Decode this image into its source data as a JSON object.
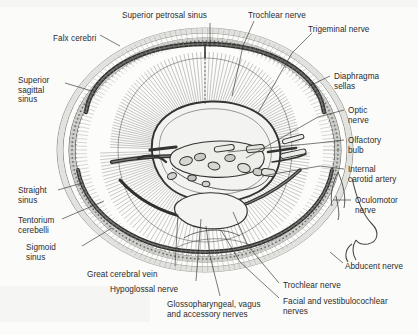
{
  "figure": {
    "kind": "anatomical-illustration",
    "view": "superior view of cranial base with dura mater, venous sinuses and cranial nerves",
    "background_color": "#fbfbfa",
    "ink_color": "#2b2b2b",
    "dura_fill": "#d9d9d6",
    "shade_fill": "#c2c2bf"
  },
  "labels": [
    {
      "id": "superior-petrosal-sinus",
      "text": "Superior petrosal sinus",
      "x": 122,
      "y": 11,
      "align": "left",
      "lines": [
        "Superior petrosal sinus"
      ]
    },
    {
      "id": "trochlear-nerve-top",
      "text": "Trochlear nerve",
      "x": 248,
      "y": 11,
      "align": "left",
      "lines": [
        "Trochlear nerve"
      ]
    },
    {
      "id": "trigeminal-nerve",
      "text": "Trigeminal nerve",
      "x": 308,
      "y": 25,
      "align": "left",
      "lines": [
        "Trigeminal nerve"
      ]
    },
    {
      "id": "falx-cerebri",
      "text": "Falx cerebri",
      "x": 53,
      "y": 34,
      "align": "left",
      "lines": [
        "Falx cerebri"
      ]
    },
    {
      "id": "superior-sagittal-sinus",
      "text": "Superior sagittal sinus",
      "x": 18,
      "y": 76,
      "align": "left",
      "lines": [
        "Superior",
        "sagittal",
        "sinus"
      ]
    },
    {
      "id": "diaphragma-sellas",
      "text": "Diaphragma sellas",
      "x": 334,
      "y": 72,
      "align": "left",
      "lines": [
        "Diaphragma",
        "sellas"
      ]
    },
    {
      "id": "optic-nerve",
      "text": "Optic nerve",
      "x": 348,
      "y": 106,
      "align": "left",
      "lines": [
        "Optic",
        "nerve"
      ]
    },
    {
      "id": "olfactory-bulb",
      "text": "Olfactory bulb",
      "x": 348,
      "y": 136,
      "align": "left",
      "lines": [
        "Olfactory",
        "bulb"
      ]
    },
    {
      "id": "internal-carotid-artery",
      "text": "Internal carotid artery",
      "x": 348,
      "y": 165,
      "align": "left",
      "lines": [
        "Internal",
        "carotid artery"
      ]
    },
    {
      "id": "oculomotor-nerve",
      "text": "Oculomotor nerve",
      "x": 355,
      "y": 196,
      "align": "left",
      "lines": [
        "Oculomotor",
        "nerve"
      ]
    },
    {
      "id": "straight-sinus",
      "text": "Straight sinus",
      "x": 18,
      "y": 186,
      "align": "left",
      "lines": [
        "Straight",
        "sinus"
      ]
    },
    {
      "id": "tentorium-cerebelli",
      "text": "Tentorium cerebelli",
      "x": 18,
      "y": 216,
      "align": "left",
      "lines": [
        "Tentorium",
        "cerebelli"
      ]
    },
    {
      "id": "sigmoid-sinus",
      "text": "Sigmoid sinus",
      "x": 26,
      "y": 243,
      "align": "left",
      "lines": [
        "Sigmoid",
        "sinus"
      ]
    },
    {
      "id": "great-cerebral-vein",
      "text": "Great cerebral vein",
      "x": 87,
      "y": 270,
      "align": "left",
      "lines": [
        "Great cerebral vein"
      ]
    },
    {
      "id": "hypoglossal-nerve",
      "text": "Hypoglossal nerve",
      "x": 110,
      "y": 285,
      "align": "left",
      "lines": [
        "Hypoglossal nerve"
      ]
    },
    {
      "id": "glossopharyngeal-vagus-accessory-nerves",
      "text": "Glossopharyngeal, vagus and accessory nerves",
      "x": 167,
      "y": 300,
      "align": "left",
      "lines": [
        "Glossopharyngeal, vagus",
        "and accessory nerves"
      ]
    },
    {
      "id": "trochlear-nerve-bottom",
      "text": "Trochlear nerve",
      "x": 283,
      "y": 281,
      "align": "left",
      "lines": [
        "Trochlear nerve"
      ]
    },
    {
      "id": "facial-and-vestibulocochlear-nerves",
      "text": "Facial and vestibulocochlear nerves",
      "x": 283,
      "y": 297,
      "align": "left",
      "lines": [
        "Facial and vestibulocochlear",
        "nerves"
      ]
    },
    {
      "id": "abducent-nerve",
      "text": "Abducent nerve",
      "x": 345,
      "y": 262,
      "align": "left",
      "lines": [
        "Abducent nerve"
      ]
    }
  ],
  "leaders": [
    {
      "id": "leader-superior-petrosal-sinus",
      "d": "M 210,23 L 210,47"
    },
    {
      "id": "leader-trochlear-nerve-top",
      "d": "M 254,21 L 243,46 L 232,96"
    },
    {
      "id": "leader-trigeminal-nerve",
      "d": "M 312,33 L 292,53 L 258,113"
    },
    {
      "id": "leader-falx-cerebri",
      "d": "M 100,35 L 120,46"
    },
    {
      "id": "leader-superior-sagittal-sinus",
      "d": "M 65,83 L 92,91"
    },
    {
      "id": "leader-diaphragma-sellas",
      "d": "M 330,76 L 309,86"
    },
    {
      "id": "leader-optic-nerve",
      "d": "M 344,110 L 318,117 L 246,158"
    },
    {
      "id": "leader-olfactory-bulb",
      "d": "M 344,140 L 318,143 L 228,152"
    },
    {
      "id": "leader-internal-carotid-artery",
      "d": "M 344,169 L 320,166 L 262,176"
    },
    {
      "id": "leader-oculomotor-nerve",
      "d": "M 351,200 L 333,200"
    },
    {
      "id": "leader-straight-sinus",
      "d": "M 58,190 L 82,183"
    },
    {
      "id": "leader-tentorium-cerebelli",
      "d": "M 62,219 L 104,201"
    },
    {
      "id": "leader-sigmoid-sinus",
      "d": "M 82,246 L 112,228"
    },
    {
      "id": "leader-great-cerebral-vein",
      "d": "M 175,266 L 178,214"
    },
    {
      "id": "leader-hypoglossal-nerve",
      "d": "M 196,281 L 201,219"
    },
    {
      "id": "leader-glossopharyngeal",
      "d": "M 220,296 L 210,256 L 206,226"
    },
    {
      "id": "leader-trochlear-nerve-bottom",
      "d": "M 279,283 L 248,246 L 233,212"
    },
    {
      "id": "leader-facial-vestibulocochlear",
      "d": "M 279,298 L 240,262 L 221,230"
    },
    {
      "id": "leader-abducent-nerve",
      "d": "M 343,263 L 330,252"
    }
  ]
}
